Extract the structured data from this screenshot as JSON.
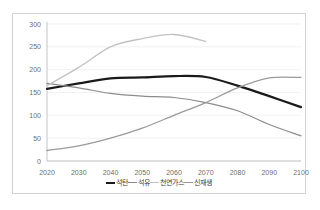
{
  "chart_data": {
    "type": "line",
    "title": "",
    "xlabel": "",
    "ylabel": "",
    "x": [
      2020,
      2030,
      2040,
      2050,
      2060,
      2070,
      2080,
      2090,
      2100
    ],
    "categories": [
      "2020",
      "2030",
      "2040",
      "2050",
      "2060",
      "2070",
      "2080",
      "2090",
      "2100"
    ],
    "xlim": [
      2020,
      2100
    ],
    "ylim": [
      0,
      300
    ],
    "yticks": [
      0,
      50,
      100,
      150,
      200,
      250,
      300
    ],
    "ytick_labels": [
      "0",
      "50",
      "100",
      "150",
      "200",
      "250",
      "300"
    ],
    "grid": "horizontal",
    "legend_position": "bottom-center",
    "series": [
      {
        "name": "석탄",
        "color": "#1a1a1a",
        "width": 2.2,
        "values": [
          158,
          170,
          181,
          183,
          186,
          184,
          165,
          142,
          118
        ]
      },
      {
        "name": "석유",
        "color": "#8c8c8c",
        "width": 1.2,
        "values": [
          170,
          160,
          148,
          142,
          139,
          128,
          110,
          80,
          55
        ]
      },
      {
        "name": "천연가스",
        "color": "#c2c2c2",
        "width": 1.3,
        "values": [
          165,
          205,
          250,
          268,
          277,
          262,
          null,
          null,
          null
        ]
      },
      {
        "name": "신재생",
        "color": "#9a9a9a",
        "width": 1.3,
        "values": [
          23,
          33,
          50,
          72,
          100,
          128,
          160,
          182,
          183
        ]
      }
    ]
  },
  "legend": {
    "items": [
      {
        "label": "석탄"
      },
      {
        "label": "석유"
      },
      {
        "label": "천연가스"
      },
      {
        "label": "신재생"
      }
    ]
  }
}
